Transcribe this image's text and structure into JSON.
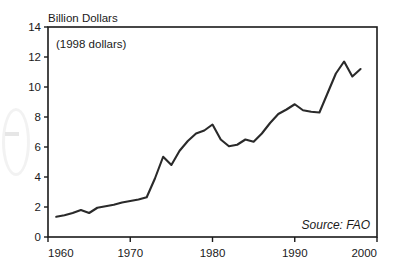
{
  "chart_data": {
    "type": "line",
    "title": "Billion Dollars",
    "subtitle": "(1998 dollars)",
    "xlabel": "",
    "ylabel": "Billion Dollars",
    "source": "Source: FAO",
    "xlim": [
      1960,
      2000
    ],
    "ylim": [
      0,
      14
    ],
    "grid": false,
    "legend": "none",
    "xticks": [
      "1960",
      "1970",
      "1980",
      "1990",
      "2000"
    ],
    "xtick_values": [
      1960,
      1970,
      1980,
      1990,
      2000
    ],
    "yticks": [
      "0",
      "2",
      "4",
      "6",
      "8",
      "10",
      "12",
      "14"
    ],
    "ytick_values": [
      0,
      2,
      4,
      6,
      8,
      10,
      12,
      14
    ],
    "series": [
      {
        "name": "Value",
        "x": [
          1961,
          1962,
          1963,
          1964,
          1965,
          1966,
          1967,
          1968,
          1969,
          1970,
          1971,
          1972,
          1973,
          1974,
          1975,
          1976,
          1977,
          1978,
          1979,
          1980,
          1981,
          1982,
          1983,
          1984,
          1985,
          1986,
          1987,
          1988,
          1989,
          1990,
          1991,
          1992,
          1993,
          1994,
          1995,
          1996,
          1997,
          1998
        ],
        "values": [
          1.35,
          1.45,
          1.6,
          1.8,
          1.6,
          1.95,
          2.05,
          2.15,
          2.3,
          2.4,
          2.5,
          2.65,
          3.9,
          5.35,
          4.8,
          5.75,
          6.4,
          6.9,
          7.1,
          7.5,
          6.5,
          6.05,
          6.15,
          6.5,
          6.35,
          6.9,
          7.6,
          8.2,
          8.5,
          8.85,
          8.45,
          8.35,
          8.3,
          9.6,
          10.9,
          11.7,
          10.7,
          11.2
        ]
      }
    ]
  },
  "annotations": {
    "title_text": "Billion Dollars",
    "note_text": "(1998 dollars)",
    "source_text": "Source: FAO"
  }
}
